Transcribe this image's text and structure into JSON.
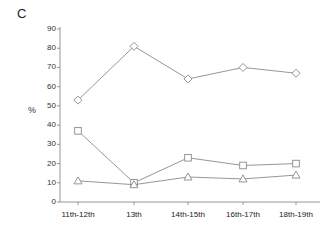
{
  "figure": {
    "panel_label": "C",
    "background_color": "#ffffff",
    "line_color": "#8a8a8a"
  },
  "chart_data": {
    "type": "line",
    "title": "",
    "panel": "C",
    "xlabel": "",
    "ylabel": "%",
    "categories": [
      "11th-12th",
      "13th",
      "14th-15th",
      "16th-17th",
      "18th-19th"
    ],
    "ylim": [
      0,
      90
    ],
    "yticks": [
      0,
      10,
      20,
      30,
      40,
      50,
      60,
      70,
      80,
      90
    ],
    "ytick_labels": [
      "0",
      "10",
      "20",
      "30",
      "40",
      "50",
      "60",
      "70",
      "80",
      "90"
    ],
    "grid": false,
    "legend": "none",
    "series": [
      {
        "name": "series-diamond",
        "marker": "diamond",
        "values": [
          53,
          81,
          64,
          70,
          67
        ]
      },
      {
        "name": "series-square",
        "marker": "square",
        "values": [
          37,
          10,
          23,
          19,
          20
        ]
      },
      {
        "name": "series-triangle",
        "marker": "triangle",
        "values": [
          11,
          9,
          13,
          12,
          14
        ]
      }
    ]
  }
}
